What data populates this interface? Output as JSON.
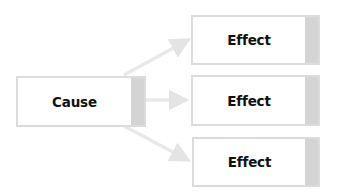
{
  "diagram": {
    "type": "cause-effect",
    "cause": {
      "label": "Cause"
    },
    "effects": [
      {
        "label": "Effect"
      },
      {
        "label": "Effect"
      },
      {
        "label": "Effect"
      }
    ]
  },
  "colors": {
    "box_border": "#dcdcdc",
    "box_tab": "#d4d4d4",
    "arrow": "#e6e6e6",
    "text": "#111111"
  }
}
